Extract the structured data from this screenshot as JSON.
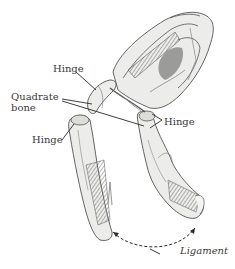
{
  "diagram": {
    "labels": {
      "hinge_top": "Hinge",
      "quadrate_line1": "Quadrate",
      "quadrate_line2": "bone",
      "hinge_right": "Hinge",
      "hinge_left": "Hinge",
      "ligament": "Ligament"
    },
    "colors": {
      "bone_fill": "#ececea",
      "bone_shade": "#9a9a96",
      "ink": "#3a3a3a",
      "background": "#ffffff"
    }
  }
}
